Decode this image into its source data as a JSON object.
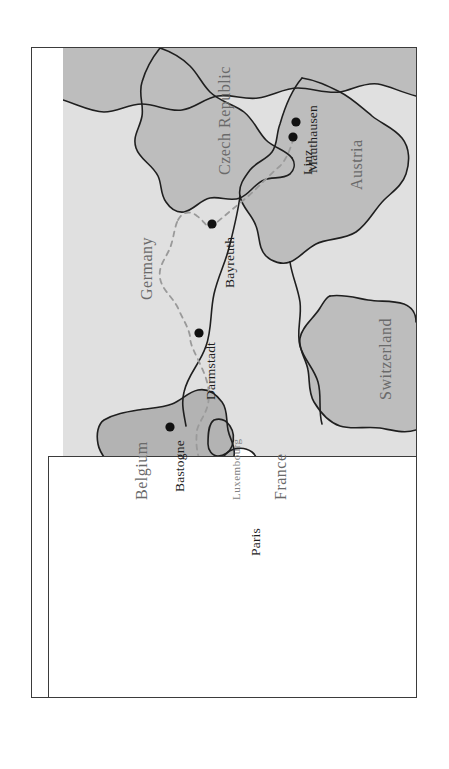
{
  "figure": {
    "kind": "map",
    "orientation_note": "rotated-90-ccw",
    "frame_border_color": "#3b3b3b",
    "page_background": "#ffffff"
  },
  "palette": {
    "land_light": "#e0e0e0",
    "land_medium": "#bdbdbd",
    "land_highlight": "#b3b3b3",
    "water_white": "#ffffff",
    "coast_line": "#1f1f1f",
    "border_line": "#2b2b2b",
    "route_line": "#9a9a9a",
    "city_dot": "#111111",
    "country_text": "#6a6a6a",
    "city_text": "#1d1d1d"
  },
  "countries": [
    {
      "name": "Germany",
      "shade": "#e0e0e0",
      "label_size": "large"
    },
    {
      "name": "Czech Republic",
      "shade": "#bdbdbd",
      "label_size": "large"
    },
    {
      "name": "Austria",
      "shade": "#bdbdbd",
      "label_size": "large"
    },
    {
      "name": "Switzerland",
      "shade": "#bdbdbd",
      "label_size": "large"
    },
    {
      "name": "France",
      "shade": "#e0e0e0",
      "label_size": "large"
    },
    {
      "name": "Belgium",
      "shade": "#b3b3b3",
      "label_size": "large"
    },
    {
      "name": "Luxembourg",
      "shade": "#b3b3b3",
      "label_size": "small"
    }
  ],
  "cities": [
    {
      "name": "Mauthausen",
      "has_dot": true,
      "country": "Austria"
    },
    {
      "name": "Linz",
      "has_dot": true,
      "country": "Austria"
    },
    {
      "name": "Bayreuth",
      "has_dot": true,
      "country": "Germany"
    },
    {
      "name": "Darmstadt",
      "has_dot": true,
      "country": "Germany"
    },
    {
      "name": "Bastogne",
      "has_dot": true,
      "country": "Belgium"
    },
    {
      "name": "Paris",
      "has_dot": true,
      "country": "France"
    }
  ],
  "route": {
    "style": "dashed",
    "color": "#9a9a9a",
    "waypoints": [
      "Paris",
      "Bastogne",
      "Darmstadt",
      "Bayreuth",
      "Linz",
      "Mauthausen"
    ]
  }
}
